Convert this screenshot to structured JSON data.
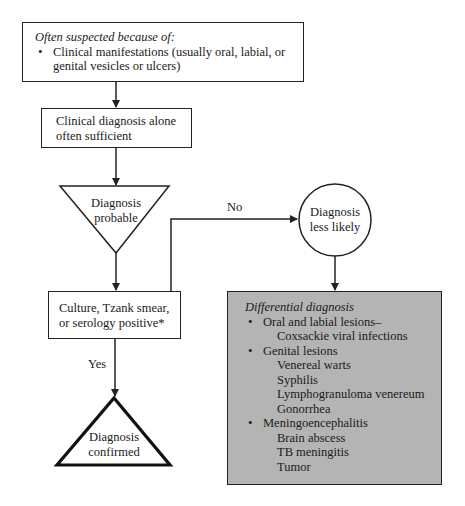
{
  "flowchart": {
    "suspicion_box": {
      "heading": "Often suspected because of:",
      "bullet": "Clinical manifestations (usually oral, labial, or",
      "bullet_cont": "genital vesicles or ulcers)"
    },
    "clinical_box": {
      "line1": "Clinical diagnosis alone",
      "line2": "often sufficient"
    },
    "probable_triangle": {
      "line1": "Diagnosis",
      "line2": "probable"
    },
    "test_box": {
      "line1": "Culture, Tzank smear,",
      "line2": "or serology positive*"
    },
    "no_label": "No",
    "yes_label": "Yes",
    "less_likely_circle": {
      "line1": "Diagnosis",
      "line2": "less likely"
    },
    "confirmed_triangle": {
      "line1": "Diagnosis",
      "line2": "confirmed"
    },
    "differential_box": {
      "heading": "Differential diagnosis",
      "groups": [
        {
          "label": "Oral and labial lesions–",
          "items": [
            "Coxsackie viral infections"
          ]
        },
        {
          "label": "Genital lesions",
          "items": [
            "Venereal warts",
            "Syphilis",
            "Lymphogranuloma venereum",
            "Gonorrhea"
          ]
        },
        {
          "label": "Meningoencephalitis",
          "items": [
            "Brain abscess",
            "TB meningitis",
            "Tumor"
          ]
        }
      ]
    },
    "colors": {
      "line": "#222222",
      "differential_fill": "#b4b4b4",
      "background": "#ffffff"
    }
  }
}
